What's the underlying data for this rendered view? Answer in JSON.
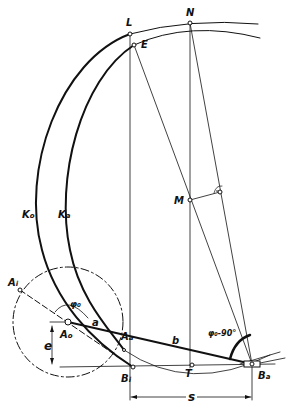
{
  "figure": {
    "stroke_color": "#111111",
    "background": "#ffffff"
  },
  "labels": {
    "L": "L",
    "E": "E",
    "N": "N",
    "M": "M",
    "Ko": "K",
    "Ko_sub": "o",
    "Ka": "K",
    "Ka_sub": "a",
    "Ai": "A",
    "Ai_sub": "i",
    "Ao": "A",
    "Ao_sub": "o",
    "Aa": "A",
    "Aa_sub": "a",
    "Bi": "B",
    "Bi_sub": "i",
    "Ba": "B",
    "Ba_sub": "a",
    "T": "T",
    "a": "a",
    "b": "b",
    "phi0": "φ₀",
    "phi_angle": "φ₀-90°",
    "e": "e",
    "s": "s"
  },
  "points": {
    "L": [
      130,
      34
    ],
    "E": [
      134,
      45
    ],
    "N": [
      190,
      23
    ],
    "M": [
      190,
      200
    ],
    "Ai": [
      20,
      290
    ],
    "Ao": [
      68,
      322
    ],
    "Aa": [
      124,
      350
    ],
    "Bi": [
      133,
      367
    ],
    "T": [
      192,
      365
    ],
    "Ba": [
      252,
      364
    ]
  }
}
